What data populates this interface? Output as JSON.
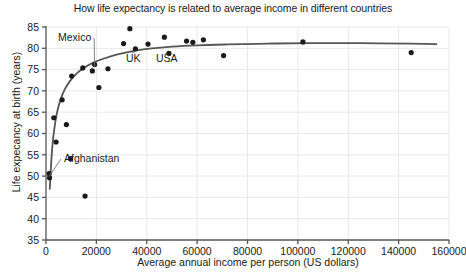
{
  "chart_data": {
    "type": "scatter",
    "title": "How life expectancy is related to average income in different countries",
    "xlabel": "Average annual income per person (US dollars)",
    "ylabel": "Life expecancy at birth (years)",
    "xlim": [
      0,
      160000
    ],
    "ylim": [
      35,
      85
    ],
    "xticks": [
      0,
      20000,
      40000,
      60000,
      80000,
      100000,
      120000,
      140000,
      160000
    ],
    "xtick_labels": [
      "0",
      "20000",
      "40000",
      "60000",
      "80000",
      "100000",
      "120000",
      "140000",
      "160000"
    ],
    "yticks": [
      35,
      40,
      45,
      50,
      55,
      60,
      65,
      70,
      75,
      80,
      85
    ],
    "ytick_labels": [
      "35",
      "40",
      "45",
      "50",
      "55",
      "60",
      "65",
      "70",
      "75",
      "80",
      "85"
    ],
    "grid": true,
    "grid_color": "#e8e8e8",
    "legend": "none",
    "marker_color": "#1a1a1a",
    "marker_size": 2.6,
    "trend_line": {
      "label": "logarithmic trend curve",
      "color": "#555555",
      "width": 1.8,
      "points": [
        [
          1500,
          47.0
        ],
        [
          2000,
          52.5
        ],
        [
          2600,
          57.5
        ],
        [
          3400,
          61.5
        ],
        [
          4400,
          65.0
        ],
        [
          5800,
          68.0
        ],
        [
          7500,
          70.4
        ],
        [
          9500,
          72.3
        ],
        [
          12000,
          74.0
        ],
        [
          15000,
          75.4
        ],
        [
          19000,
          76.7
        ],
        [
          23000,
          77.6
        ],
        [
          28000,
          78.5
        ],
        [
          34000,
          79.3
        ],
        [
          41000,
          79.9
        ],
        [
          50000,
          80.4
        ],
        [
          60000,
          80.7
        ],
        [
          72000,
          80.9
        ],
        [
          88000,
          81.1
        ],
        [
          105000,
          81.2
        ],
        [
          125000,
          81.2
        ],
        [
          145000,
          81.1
        ],
        [
          155000,
          81.0
        ]
      ]
    },
    "points": [
      {
        "x": 1200,
        "y": 50.6,
        "label": "Afghanistan"
      },
      {
        "x": 1400,
        "y": 49.6,
        "label": ""
      },
      {
        "x": 3100,
        "y": 63.7,
        "label": ""
      },
      {
        "x": 4000,
        "y": 58.0,
        "label": ""
      },
      {
        "x": 6400,
        "y": 67.9,
        "label": ""
      },
      {
        "x": 8100,
        "y": 62.1,
        "label": ""
      },
      {
        "x": 9700,
        "y": 54.1,
        "label": ""
      },
      {
        "x": 10200,
        "y": 73.5,
        "label": ""
      },
      {
        "x": 14600,
        "y": 75.4,
        "label": ""
      },
      {
        "x": 15500,
        "y": 45.3,
        "label": ""
      },
      {
        "x": 18400,
        "y": 74.7,
        "label": ""
      },
      {
        "x": 19300,
        "y": 76.2,
        "label": "Mexico"
      },
      {
        "x": 21000,
        "y": 70.8,
        "label": ""
      },
      {
        "x": 24600,
        "y": 75.2,
        "label": ""
      },
      {
        "x": 30800,
        "y": 81.1,
        "label": ""
      },
      {
        "x": 33300,
        "y": 84.6,
        "label": ""
      },
      {
        "x": 35500,
        "y": 79.9,
        "label": "UK"
      },
      {
        "x": 40500,
        "y": 81.0,
        "label": ""
      },
      {
        "x": 47000,
        "y": 82.6,
        "label": ""
      },
      {
        "x": 48800,
        "y": 78.8,
        "label": "USA"
      },
      {
        "x": 55800,
        "y": 81.7,
        "label": ""
      },
      {
        "x": 58300,
        "y": 81.4,
        "label": ""
      },
      {
        "x": 62500,
        "y": 82.0,
        "label": ""
      },
      {
        "x": 70500,
        "y": 78.3,
        "label": ""
      },
      {
        "x": 102000,
        "y": 81.5,
        "label": ""
      },
      {
        "x": 145000,
        "y": 79.0,
        "label": ""
      }
    ],
    "annotations": [
      {
        "text": "Mexico",
        "x_px": 58,
        "y_px": 41,
        "leader_to": [
          19300,
          76.2
        ]
      },
      {
        "text": "Afghanistan",
        "x_px": 64,
        "y_px": 162,
        "leader_to": [
          1200,
          50.6
        ]
      },
      {
        "text": "UK",
        "x_px": 126,
        "y_px": 62,
        "leader_to": [
          35500,
          79.9
        ]
      },
      {
        "text": "USA",
        "x_px": 156,
        "y_px": 62,
        "leader_to": [
          48800,
          78.8
        ]
      }
    ]
  }
}
